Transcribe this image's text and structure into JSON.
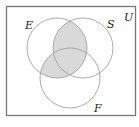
{
  "diagram": {
    "type": "venn",
    "universe_label": "U",
    "sets": [
      {
        "name": "E",
        "label": "E"
      },
      {
        "name": "S",
        "label": "S"
      },
      {
        "name": "F",
        "label": "F"
      }
    ],
    "shaded_regions": [
      "E∩S",
      "E∩F"
    ],
    "colors": {
      "shade": "#d9d9d9",
      "circle_stroke": "#a0a0a0",
      "border": "#777777",
      "background": "#ffffff"
    }
  }
}
